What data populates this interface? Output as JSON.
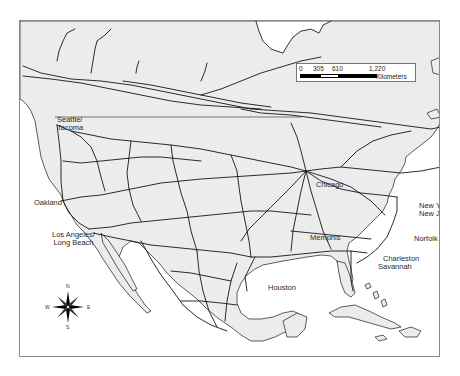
{
  "map": {
    "title": "North American rail network",
    "colors": {
      "land": "#ececec",
      "water": "#ffffff",
      "rail": "#151515",
      "border": "#8a8a8a"
    }
  },
  "scale_bar": {
    "ticks": [
      "0",
      "305",
      "610",
      "1,220"
    ],
    "unit": "Kilometers"
  },
  "compass": {
    "n": "N",
    "s": "S",
    "e": "E",
    "w": "W"
  },
  "cities": [
    {
      "id": "seattle",
      "line1": "Seattle/",
      "line2": "Tacoma"
    },
    {
      "id": "oakland",
      "line1": "Oakland"
    },
    {
      "id": "los-angeles",
      "line1": "Los Angeles/",
      "line2": "Long Beach"
    },
    {
      "id": "chicago",
      "line1": "Chicago"
    },
    {
      "id": "memphis",
      "line1": "Memphis"
    },
    {
      "id": "houston",
      "line1": "Houston"
    },
    {
      "id": "new-york",
      "line1": "New York/",
      "line2": "New Jersey"
    },
    {
      "id": "norfolk",
      "line1": "Norfolk"
    },
    {
      "id": "charleston",
      "line1": "Charleston"
    },
    {
      "id": "savannah",
      "line1": "Savannah"
    }
  ]
}
